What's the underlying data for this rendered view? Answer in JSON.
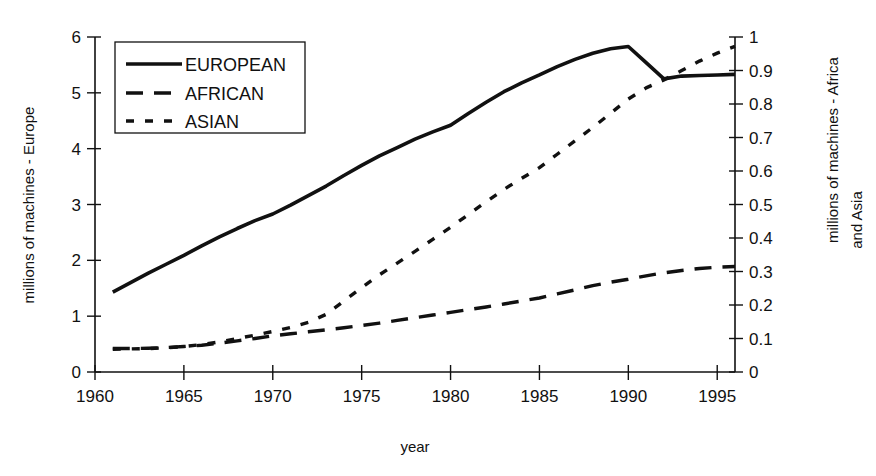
{
  "chart_data": {
    "type": "line",
    "title": "",
    "xlabel": "year",
    "ylabel": "millions of machines - Europe",
    "ylabel_right": "millions of machines - Africa and Asia",
    "xlim": [
      1960,
      1996
    ],
    "ylim": [
      0,
      6
    ],
    "ylim_right": [
      0,
      1
    ],
    "xticks": [
      1960,
      1965,
      1970,
      1975,
      1980,
      1985,
      1990,
      1995
    ],
    "xticklabels": [
      "1960",
      "1965",
      "1970",
      "1975",
      "1980",
      "1985",
      "1990",
      "1995"
    ],
    "yticks": [
      0,
      1,
      2,
      3,
      4,
      5,
      6
    ],
    "yticklabels": [
      "0",
      "1",
      "2",
      "3",
      "4",
      "5",
      "6"
    ],
    "yticks_right": [
      0,
      0.1,
      0.2,
      0.3,
      0.4,
      0.5,
      0.6,
      0.7,
      0.8,
      0.9,
      1
    ],
    "yticklabels_right": [
      "0",
      "0.1",
      "0.2",
      "0.3",
      "0.4",
      "0.5",
      "0.6",
      "0.7",
      "0.8",
      "0.9",
      "1"
    ],
    "grid": false,
    "legend_position": "upper left",
    "series": [
      {
        "name": "EUROPEAN",
        "axis": "left",
        "style": "solid",
        "x": [
          1961,
          1962,
          1963,
          1964,
          1965,
          1966,
          1967,
          1968,
          1969,
          1970,
          1971,
          1972,
          1973,
          1974,
          1975,
          1976,
          1977,
          1978,
          1979,
          1980,
          1981,
          1982,
          1983,
          1984,
          1985,
          1986,
          1987,
          1988,
          1989,
          1990,
          1991,
          1992,
          1993,
          1994,
          1995,
          1996
        ],
        "values": [
          1.43,
          1.6,
          1.77,
          1.93,
          2.09,
          2.26,
          2.42,
          2.57,
          2.71,
          2.83,
          2.99,
          3.16,
          3.33,
          3.52,
          3.7,
          3.87,
          4.02,
          4.17,
          4.3,
          4.42,
          4.63,
          4.83,
          5.02,
          5.18,
          5.32,
          5.47,
          5.6,
          5.71,
          5.79,
          5.83,
          5.54,
          5.25,
          5.3,
          5.31,
          5.32,
          5.33
        ]
      },
      {
        "name": "AFRICAN",
        "axis": "right",
        "style": "dashed",
        "x": [
          1961,
          1962,
          1963,
          1964,
          1965,
          1966,
          1967,
          1968,
          1969,
          1970,
          1971,
          1972,
          1973,
          1974,
          1975,
          1976,
          1977,
          1978,
          1979,
          1980,
          1981,
          1982,
          1983,
          1984,
          1985,
          1986,
          1987,
          1988,
          1989,
          1990,
          1991,
          1992,
          1993,
          1994,
          1995,
          1996
        ],
        "values": [
          0.07,
          0.07,
          0.071,
          0.073,
          0.076,
          0.08,
          0.086,
          0.093,
          0.1,
          0.108,
          0.114,
          0.12,
          0.126,
          0.132,
          0.139,
          0.146,
          0.154,
          0.162,
          0.17,
          0.178,
          0.186,
          0.194,
          0.203,
          0.212,
          0.221,
          0.233,
          0.245,
          0.258,
          0.268,
          0.277,
          0.287,
          0.296,
          0.303,
          0.309,
          0.313,
          0.315
        ]
      },
      {
        "name": "ASIAN",
        "axis": "right",
        "style": "dotted",
        "x": [
          1961,
          1962,
          1963,
          1964,
          1965,
          1966,
          1967,
          1968,
          1969,
          1970,
          1971,
          1972,
          1973,
          1974,
          1975,
          1976,
          1977,
          1978,
          1979,
          1980,
          1981,
          1982,
          1983,
          1984,
          1985,
          1986,
          1987,
          1988,
          1989,
          1990,
          1991,
          1992,
          1993,
          1994,
          1995,
          1996
        ],
        "values": [
          0.068,
          0.069,
          0.07,
          0.072,
          0.076,
          0.082,
          0.09,
          0.1,
          0.11,
          0.121,
          0.133,
          0.148,
          0.172,
          0.212,
          0.252,
          0.29,
          0.325,
          0.36,
          0.396,
          0.432,
          0.47,
          0.508,
          0.545,
          0.578,
          0.61,
          0.65,
          0.69,
          0.73,
          0.772,
          0.815,
          0.848,
          0.872,
          0.9,
          0.928,
          0.952,
          0.972
        ]
      }
    ]
  },
  "legend": {
    "entries": [
      {
        "label": "EUROPEAN",
        "style": "solid"
      },
      {
        "label": "AFRICAN",
        "style": "dashed"
      },
      {
        "label": "ASIAN",
        "style": "dotted"
      }
    ]
  }
}
